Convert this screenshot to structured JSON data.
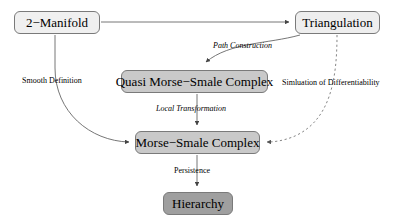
{
  "diagram": {
    "background_color": "#ffffff",
    "stroke_color": "#555555",
    "nodes": [
      {
        "id": "manifold",
        "label": "2−Manifold",
        "fill": "#f0f0f0",
        "border": "#7a7a7a"
      },
      {
        "id": "triangulation",
        "label": "Triangulation",
        "fill": "#eeeeee",
        "border": "#7a7a7a"
      },
      {
        "id": "quasi",
        "label": "Quasi Morse−Smale Complex",
        "fill": "#c9c9c9",
        "border": "#7a7a7a"
      },
      {
        "id": "msc",
        "label": "Morse−Smale Complex",
        "fill": "#c9c9c9",
        "border": "#7a7a7a"
      },
      {
        "id": "hierarchy",
        "label": "Hierarchy",
        "fill": "#9f9f9f",
        "border": "#7a7a7a"
      }
    ],
    "edges": [
      {
        "id": "manifold-to-triangulation",
        "from": "manifold",
        "to": "triangulation",
        "label": "",
        "style": "solid",
        "arrow": true
      },
      {
        "id": "manifold-to-msc",
        "from": "manifold",
        "to": "msc",
        "label": "Smooth Definition",
        "style": "solid",
        "italic": false,
        "arrow": true
      },
      {
        "id": "triangulation-to-quasi",
        "from": "triangulation",
        "to": "quasi",
        "label": "Path Construction",
        "style": "solid",
        "italic": true,
        "arrow": true
      },
      {
        "id": "triangulation-to-msc",
        "from": "triangulation",
        "to": "msc",
        "label": "Simluation of Differentiability",
        "style": "dashed",
        "italic": false,
        "arrow": true
      },
      {
        "id": "quasi-to-msc",
        "from": "quasi",
        "to": "msc",
        "label": "Local Transformation",
        "style": "solid",
        "italic": true,
        "arrow": true
      },
      {
        "id": "msc-to-hierarchy",
        "from": "msc",
        "to": "hierarchy",
        "label": "Persistence",
        "style": "solid",
        "italic": false,
        "arrow": true
      }
    ]
  }
}
